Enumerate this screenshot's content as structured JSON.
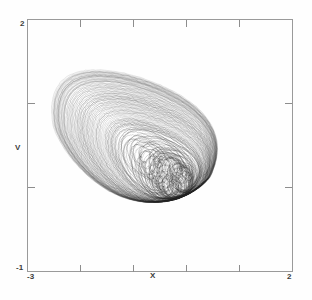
{
  "figure": {
    "kind": "phase-portrait",
    "background": "#ffffff",
    "frame_color": "#9a9a9a",
    "curve_color": "#2b2b2b"
  },
  "axes": {
    "x_label": "X",
    "y_label": "V",
    "x_min_label": "-3",
    "x_max_label": "2",
    "y_min_label": "-1",
    "y_max_label": "2",
    "x_ticks_interior": [
      -2,
      -1,
      0,
      1
    ],
    "y_ticks_interior": [
      0,
      1
    ]
  },
  "chart_data": {
    "type": "line",
    "title": "",
    "subtitle": "",
    "xlabel": "X",
    "ylabel": "V",
    "xlim": [
      -3,
      2
    ],
    "ylim": [
      -1,
      2
    ],
    "xticks": [
      -3,
      -2,
      -1,
      0,
      1,
      2
    ],
    "xtick_labels": [
      "-3",
      "",
      "",
      "",
      "",
      "2"
    ],
    "yticks": [
      -1,
      0,
      1,
      2
    ],
    "ytick_labels": [
      "-1",
      "",
      "",
      "2"
    ],
    "grid": false,
    "legend": null,
    "annotations": [],
    "series": [
      {
        "name": "trajectory",
        "description": "Dense set of nested quasi-periodic orbits forming a chaotic attractor; outer egg-shaped envelope with a chain of small inner loops near the core.",
        "color": "#2b2b2b",
        "linewidth": 0.35,
        "opacity": 0.55,
        "extent_x": [
          -2.05,
          1.45
        ],
        "extent_y": [
          -0.78,
          1.15
        ],
        "core_center": [
          -0.55,
          0.16
        ],
        "n_orbits": 90
      }
    ]
  }
}
